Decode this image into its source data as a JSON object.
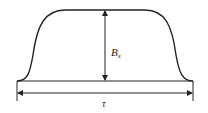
{
  "diagram": {
    "title": "",
    "labels": {
      "amplitude_main": "B",
      "amplitude_sub": "x",
      "width": "τ"
    },
    "colors": {
      "stroke": "#222222",
      "background": "#ffffff"
    },
    "shape": "flat-top pulse (trapezoidal with rounded edges)",
    "annotations": [
      {
        "type": "vertical double arrow",
        "label": "B_x",
        "meaning": "pulse amplitude"
      },
      {
        "type": "horizontal double arrow",
        "label": "τ",
        "meaning": "pulse width"
      }
    ]
  }
}
